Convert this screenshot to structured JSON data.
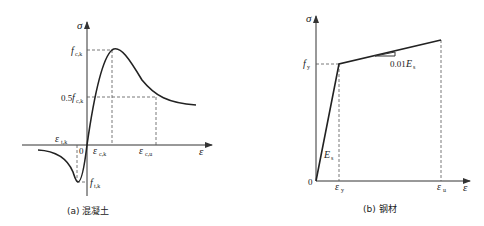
{
  "concrete": {
    "caption": "(a) 混凝土",
    "axis_y": "σ",
    "axis_x": "ε",
    "origin": "0",
    "peak_stress": {
      "main": "f",
      "sub": "c,k"
    },
    "half_peak_stress": {
      "prefix": "0.5",
      "main": "f",
      "sub": "c,k"
    },
    "tensile_strain": {
      "main": "ε",
      "sub": "t,k"
    },
    "tensile_stress": {
      "main": "f",
      "sub": "t,k"
    },
    "peak_strain": {
      "main": "ε",
      "sub": "c,k"
    },
    "ultimate_strain": {
      "main": "ε",
      "sub": "c,u"
    }
  },
  "steel": {
    "caption": "(b) 钢材",
    "axis_y": "σ",
    "axis_x": "ε",
    "origin": "0",
    "yield_stress": {
      "main": "f",
      "sub": "y"
    },
    "hardening_slope": {
      "prefix": "0.01",
      "main": "E",
      "sub": "s"
    },
    "elastic_modulus": {
      "main": "E",
      "sub": "s"
    },
    "yield_strain": {
      "main": "ε",
      "sub": "y"
    },
    "ultimate_strain": {
      "main": "ε",
      "sub": "u"
    }
  }
}
